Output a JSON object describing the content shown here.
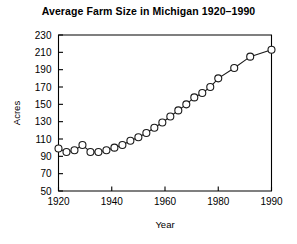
{
  "chart_data": {
    "type": "line",
    "title": "Average Farm Size in Michigan 1920–1990",
    "xlabel": "Year",
    "ylabel": "Acres",
    "xlim": [
      1920,
      1990
    ],
    "ylim": [
      50,
      230
    ],
    "xticks": [
      1920,
      1940,
      1960,
      1980,
      1990
    ],
    "xtick_labels": [
      "1920",
      "1940",
      "1960",
      "1980",
      "1990"
    ],
    "yticks": [
      50,
      70,
      90,
      110,
      130,
      150,
      170,
      190,
      210,
      230
    ],
    "ytick_labels": [
      "50",
      "70",
      "90",
      "110",
      "130",
      "150",
      "170",
      "190",
      "210",
      "230"
    ],
    "grid": false,
    "legend": false,
    "marker": "open-circle",
    "line_color": "#1a1a1a",
    "marker_face_color": "#ffffff",
    "x": [
      1920,
      1923,
      1926,
      1929,
      1932,
      1935,
      1938,
      1941,
      1944,
      1947,
      1950,
      1953,
      1956,
      1959,
      1962,
      1965,
      1968,
      1971,
      1974,
      1977,
      1980,
      1983,
      1986,
      1990
    ],
    "values": [
      99,
      95,
      97,
      103,
      95,
      95,
      97,
      100,
      103,
      108,
      112,
      117,
      123,
      129,
      136,
      143,
      150,
      158,
      163,
      170,
      180,
      192,
      205,
      213
    ],
    "series": [
      {
        "name": "Average farm size",
        "values": [
          99,
          95,
          97,
          103,
          95,
          95,
          97,
          100,
          103,
          108,
          112,
          117,
          123,
          129,
          136,
          143,
          150,
          158,
          163,
          170,
          180,
          192,
          205,
          213
        ]
      }
    ]
  }
}
